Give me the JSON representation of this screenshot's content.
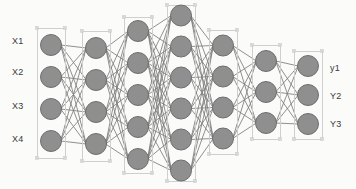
{
  "figure": {
    "kind": "neural-network-diagram",
    "width": 356,
    "height": 189,
    "background_color": "#fbfbfa"
  },
  "style": {
    "node_fill": "#8f8f8f",
    "node_stroke": "#6e6e6e",
    "node_stroke_width": 1,
    "edge_color": "#7c7c7c",
    "edge_width": 0.9,
    "group_box_stroke": "#cfcfcf",
    "group_box_fill": "none",
    "handle_color": "#d8d8d8",
    "label_color": "#3a3a3a",
    "label_font_size": 9
  },
  "network": {
    "layer_count": 7,
    "node_radius": 10.5,
    "layers": [
      {
        "id": "input",
        "name": "input-layer",
        "node_count": 4,
        "cx": 51,
        "cy": 93,
        "spacing": 32,
        "box": {
          "x": 37,
          "y": 28,
          "w": 28,
          "h": 130
        }
      },
      {
        "id": "hidden-1",
        "name": "hidden-layer-1",
        "node_count": 4,
        "cx": 96,
        "cy": 96,
        "spacing": 32,
        "box": {
          "x": 82,
          "y": 31,
          "w": 28,
          "h": 130
        }
      },
      {
        "id": "hidden-2",
        "name": "hidden-layer-2",
        "node_count": 5,
        "cx": 138,
        "cy": 95,
        "spacing": 32,
        "box": {
          "x": 124,
          "y": 17,
          "w": 28,
          "h": 156
        }
      },
      {
        "id": "hidden-3",
        "name": "hidden-layer-3",
        "node_count": 6,
        "cx": 181,
        "cy": 93,
        "spacing": 31,
        "box": {
          "x": 167,
          "y": 5,
          "w": 28,
          "h": 176
        }
      },
      {
        "id": "hidden-4",
        "name": "hidden-layer-4",
        "node_count": 4,
        "cx": 223,
        "cy": 92,
        "spacing": 31,
        "box": {
          "x": 209,
          "y": 30,
          "w": 28,
          "h": 124
        }
      },
      {
        "id": "hidden-5",
        "name": "hidden-layer-5",
        "node_count": 3,
        "cx": 266,
        "cy": 92,
        "spacing": 31,
        "box": {
          "x": 252,
          "y": 45,
          "w": 28,
          "h": 94
        }
      },
      {
        "id": "output",
        "name": "output-layer",
        "node_count": 3,
        "cx": 308,
        "cy": 95,
        "spacing": 29,
        "box": {
          "x": 294,
          "y": 51,
          "w": 28,
          "h": 88
        }
      }
    ]
  },
  "input_labels": [
    {
      "text": "X1",
      "x": 12,
      "y": 41
    },
    {
      "text": "X2",
      "x": 12,
      "y": 72
    },
    {
      "text": "X3",
      "x": 12,
      "y": 106
    },
    {
      "text": "X4",
      "x": 12,
      "y": 139
    }
  ],
  "output_labels": [
    {
      "text": "y1",
      "x": 330,
      "y": 68
    },
    {
      "text": "Y2",
      "x": 330,
      "y": 96
    },
    {
      "text": "Y3",
      "x": 330,
      "y": 124
    }
  ]
}
